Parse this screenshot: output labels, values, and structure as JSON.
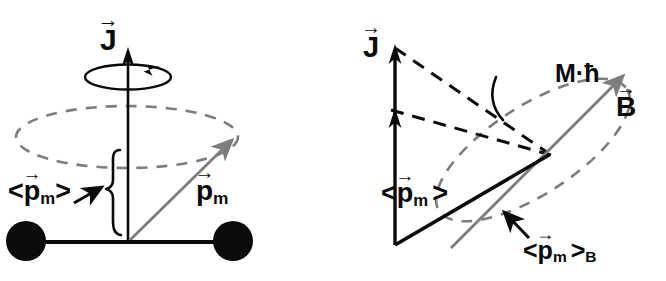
{
  "figure": {
    "background_color": "#ffffff",
    "ink_color": "#0a0a0a",
    "gray_color": "#7d7d7d"
  },
  "panels": [
    {
      "id": "left",
      "name": "precession-of-pm-about-J",
      "labels": {
        "angular_momentum": {
          "base": "J",
          "accent": "→"
        },
        "magnetic_moment": {
          "base": "p",
          "sub": "m",
          "accent": "→"
        },
        "mean_magnetic_moment": {
          "open": "<",
          "base": "p",
          "sub": "m",
          "accent": "→",
          "close": ">"
        }
      },
      "elements": {
        "atom_left": "atom-sphere-left",
        "atom_right": "atom-sphere-right",
        "bond": "molecular-bond",
        "cone_base": "precession-ellipse",
        "brace": "mean-value-brace",
        "spin_circle": "spin-rotation-circle",
        "pointer": "pointer-arrow"
      }
    },
    {
      "id": "right",
      "name": "projection-of-pm-onto-B",
      "labels": {
        "angular_momentum": {
          "base": "J",
          "accent": "→"
        },
        "magnetic_field": {
          "base": "B",
          "accent": "→"
        },
        "mean_magnetic_moment": {
          "open": "<",
          "base": "p",
          "sub": "m",
          "accent": "→",
          "close": ">"
        },
        "projected_moment": {
          "open": "<",
          "base": "p",
          "sub": "m",
          "accent": "→",
          "close": ">",
          "sub2": "B"
        },
        "quantized_projection": "M·ħ"
      },
      "elements": {
        "axis_vector": "J-axis-arrow",
        "pm_vector": "mean-pm-arrow",
        "pm_b_vector": "pm-projected-on-B-arrow",
        "b_vector": "B-field-arrow",
        "cone_black": "precession-cone-dashed-black",
        "cone_gray": "precession-cone-dashed-gray",
        "angle_arc": "projection-angle-arc",
        "pointer": "pointer-arrow"
      }
    }
  ]
}
